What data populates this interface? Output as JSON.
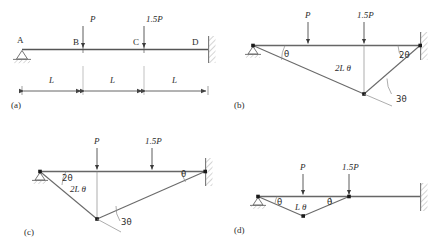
{
  "figure": {
    "line_color": "#555555",
    "text_color": "#2b2b2b",
    "hatch_color": "#9a9a9a"
  },
  "panels": [
    {
      "id": "(a)",
      "name": "beam-geometry",
      "node_labels": [
        "A",
        "B",
        "C",
        "D"
      ],
      "loads": [
        {
          "label": "P",
          "at": "B"
        },
        {
          "label": "1.5P",
          "at": "C"
        }
      ],
      "dimensions": [
        "L",
        "L",
        "L"
      ],
      "supports": [
        "pin",
        "fixed"
      ]
    },
    {
      "id": "(b)",
      "name": "mechanism-hinge-at-c",
      "loads": [
        {
          "label": "P",
          "at": "B"
        },
        {
          "label": "1.5P",
          "at": "C"
        }
      ],
      "angles": [
        "θ",
        "2θ",
        "3θ"
      ],
      "displacement": "2L θ",
      "supports": [
        "pin",
        "fixed"
      ]
    },
    {
      "id": "(c)",
      "name": "mechanism-hinge-at-b",
      "loads": [
        {
          "label": "P",
          "at": "B"
        },
        {
          "label": "1.5P",
          "at": "C"
        }
      ],
      "angles": [
        "2θ",
        "θ",
        "3θ"
      ],
      "displacement": "2L θ",
      "supports": [
        "pin",
        "fixed"
      ]
    },
    {
      "id": "(d)",
      "name": "mechanism-local-span-ab-bc",
      "loads": [
        {
          "label": "P",
          "at": "B"
        },
        {
          "label": "1.5P",
          "at": "C"
        }
      ],
      "angles": [
        "θ",
        "θ"
      ],
      "displacement": "L θ",
      "supports": [
        "pin",
        "fixed"
      ]
    }
  ]
}
